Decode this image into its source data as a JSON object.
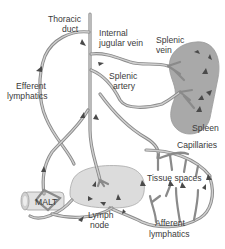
{
  "diagram": {
    "labels": {
      "thoracic_duct_1": "Thoracic",
      "thoracic_duct_2": "duct",
      "internal_jugular_1": "Internal",
      "internal_jugular_2": "jugular vein",
      "splenic_vein_1": "Splenic",
      "splenic_vein_2": "vein",
      "efferent_1": "Efferent",
      "efferent_2": "lymphatics",
      "splenic_artery_1": "Splenic",
      "splenic_artery_2": "artery",
      "spleen": "Spleen",
      "capillaries": "Capillaries",
      "tissue_spaces": "Tissue spaces",
      "malt": "MALT",
      "lymph_node_1": "Lymph",
      "lymph_node_2": "node",
      "afferent_1": "Afferent",
      "afferent_2": "lymphatics"
    },
    "colors": {
      "vessel": "#8a8a8a",
      "vessel_highlight": "#cfcfcf",
      "spleen_fill": "#a9a9a9",
      "lymph_node_fill": "#dcdcdc",
      "malt_fill": "#e2e2e2",
      "arrow": "#4a4a4a",
      "text": "#3a3a3a"
    }
  }
}
